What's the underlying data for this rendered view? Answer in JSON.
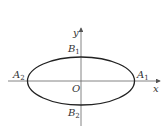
{
  "diagram": {
    "axes": {
      "x_label": "x",
      "y_label": "y",
      "origin_label": "O"
    },
    "vertices": {
      "A1": {
        "letter": "A",
        "sub": "1"
      },
      "A2": {
        "letter": "A",
        "sub": "2"
      },
      "B1": {
        "letter": "B",
        "sub": "1"
      },
      "B2": {
        "letter": "B",
        "sub": "2"
      }
    },
    "colors": {
      "curve": "#222222",
      "axis": "#555555",
      "text": "#333333"
    }
  }
}
